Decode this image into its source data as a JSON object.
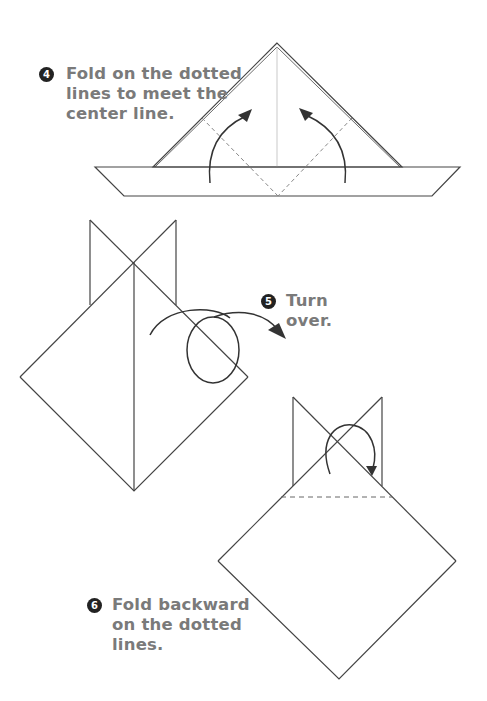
{
  "steps": [
    {
      "number": "4",
      "lines": [
        "Fold on the dotted",
        "lines to meet the",
        "center line."
      ]
    },
    {
      "number": "5",
      "lines": [
        "Turn",
        "over."
      ]
    },
    {
      "number": "6",
      "lines": [
        "Fold backward",
        "on the dotted",
        "lines."
      ]
    }
  ],
  "colors": {
    "text": "#7a7a7a",
    "line": "#333333",
    "dashed": "#888888",
    "badge": "#222222"
  }
}
